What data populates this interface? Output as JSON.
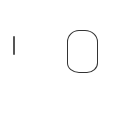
{
  "digits": [
    {
      "value": "1",
      "stroke_color": "#555555"
    },
    {
      "value": "0",
      "stroke_color": "#333333"
    }
  ],
  "background": "#ffffff"
}
